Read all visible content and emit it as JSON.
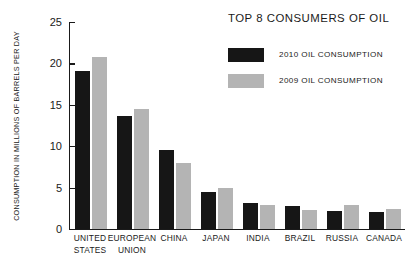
{
  "chart_data": {
    "type": "bar",
    "title": "TOP 8 CONSUMERS OF OIL",
    "xlabel": "",
    "ylabel": "CONSUMPTION IN MILLIONS OF BARRELS PER DAY",
    "ylim": [
      0,
      25
    ],
    "yticks": [
      0,
      5,
      10,
      15,
      20,
      25
    ],
    "ytick_labels": [
      "0",
      "5",
      "10",
      "15",
      "20",
      "25"
    ],
    "grid": false,
    "legend_position": "top-right",
    "categories": [
      "UNITED STATES",
      "EUROPEAN UNION",
      "CHINA",
      "JAPAN",
      "INDIA",
      "BRAZIL",
      "RUSSIA",
      "CANADA"
    ],
    "category_lines": [
      [
        "UNITED",
        "STATES"
      ],
      [
        "EUROPEAN",
        "UNION"
      ],
      [
        "CHINA"
      ],
      [
        "JAPAN"
      ],
      [
        "INDIA"
      ],
      [
        "BRAZIL"
      ],
      [
        "RUSSIA"
      ],
      [
        "CANADA"
      ]
    ],
    "series": [
      {
        "name": "2010 OIL CONSUMPTION",
        "color": "#161616",
        "values": [
          19.1,
          13.7,
          9.5,
          4.5,
          3.1,
          2.8,
          2.2,
          2.1
        ]
      },
      {
        "name": "2009 OIL CONSUMPTION",
        "color": "#b4b4b4",
        "values": [
          20.8,
          14.5,
          8.0,
          4.9,
          2.9,
          2.3,
          2.9,
          2.4
        ]
      }
    ]
  },
  "legend": {
    "items": [
      {
        "label": "2010 OIL CONSUMPTION",
        "swatch": "dark"
      },
      {
        "label": "2009 OIL CONSUMPTION",
        "swatch": "light"
      }
    ]
  },
  "colors": {
    "series_2010": "#161616",
    "series_2009": "#b4b4b4",
    "axis": "#1a1a1a",
    "background": "#ffffff"
  }
}
